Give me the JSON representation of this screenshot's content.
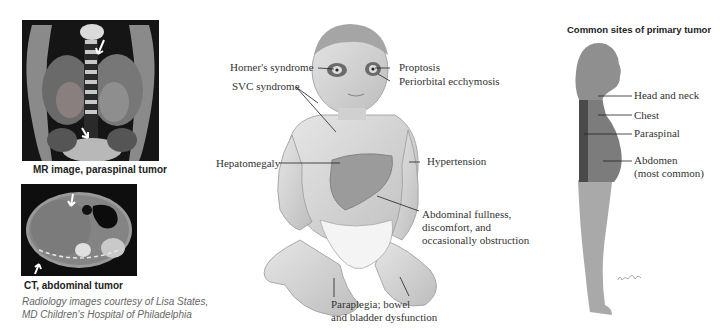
{
  "radiology": {
    "mr": {
      "caption": "MR image, paraspinal tumor",
      "arrows": 2
    },
    "ct": {
      "caption": "CT, abdominal tumor",
      "arrows": 2
    },
    "credit_line1": "Radiology images courtesy of Lisa States,",
    "credit_line2": "MD Children's Hospital of Philadelphia"
  },
  "child_figure": {
    "labels": {
      "horners": "Horner's syndrome",
      "svc": "SVC syndrome",
      "proptosis": "Proptosis",
      "periorbital": "Periorbital ecchymosis",
      "hepatomegaly": "Hepatomegaly",
      "hypertension": "Hypertension",
      "abdominal_l1": "Abdominal fullness,",
      "abdominal_l2": "discomfort, and",
      "abdominal_l3": "occasionally obstruction",
      "paraplegia_l1": "Paraplegia; bowel",
      "paraplegia_l2": "and bladder dysfunction"
    }
  },
  "silhouette": {
    "title": "Common sites of primary tumor",
    "sites": {
      "head_neck": "Head and neck",
      "chest": "Chest",
      "paraspinal": "Paraspinal",
      "abdomen_l1": "Abdomen",
      "abdomen_l2": "(most common)"
    },
    "signature": "signature",
    "colors": {
      "body_light": "#a9a9a9",
      "torso_mid": "#7c7c7c",
      "paraspinal_dark": "#4a4a4a"
    }
  }
}
